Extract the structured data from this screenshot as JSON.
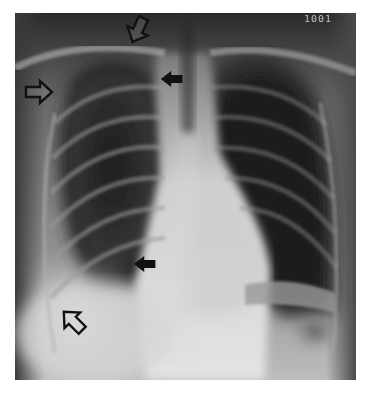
{
  "image": {
    "type": "chest-radiograph",
    "view": "PA",
    "corner_marker_text": "1001"
  },
  "annotations": [
    {
      "id": "open-arrow-top",
      "style": "open",
      "direction": "down-left",
      "x": 118,
      "y": 18,
      "rotation": 120
    },
    {
      "id": "open-arrow-upper-left",
      "style": "open",
      "direction": "right",
      "x": 22,
      "y": 80,
      "rotation": 0
    },
    {
      "id": "solid-arrow-upper",
      "style": "solid",
      "direction": "left",
      "x": 158,
      "y": 72,
      "rotation": 180
    },
    {
      "id": "solid-arrow-lower",
      "style": "solid",
      "direction": "left",
      "x": 131,
      "y": 255,
      "rotation": 180
    },
    {
      "id": "open-arrow-lower-left",
      "style": "open",
      "direction": "up-left",
      "x": 57,
      "y": 305,
      "rotation": 225
    }
  ],
  "colors": {
    "border": "#ffffff",
    "arrow_stroke": "#111111",
    "arrow_open_fill": "#ffffff",
    "arrow_solid_fill": "#111111"
  }
}
